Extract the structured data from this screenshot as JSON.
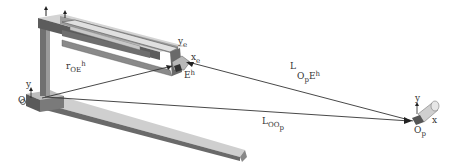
{
  "diagram": {
    "labels": {
      "r_OE_h": {
        "main": "r",
        "sub": "OE",
        "sup": "h"
      },
      "L_OpE_h": {
        "main": "L",
        "sub1": "O",
        "subsub": "p",
        "mid": "E",
        "sup": "h"
      },
      "L_OOp": {
        "main": "L",
        "sub": "OO",
        "subsub": "p"
      },
      "y_e": {
        "main": "y",
        "sub": "e"
      },
      "x_e": {
        "main": "x",
        "sub": "e"
      },
      "E_h": {
        "main": "E",
        "sup": "h"
      },
      "O": "O",
      "y_origin": "y",
      "Op": {
        "main": "O",
        "sub": "p"
      },
      "y_p": "y",
      "x_p": "x"
    },
    "colors": {
      "metal_light": "#d9d9d9",
      "metal_mid": "#a8a8a8",
      "metal_dark": "#5a5a5a",
      "vector_line": "#333333"
    }
  }
}
